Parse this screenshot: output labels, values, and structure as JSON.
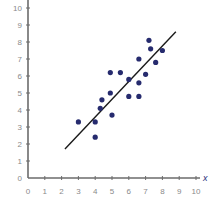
{
  "chart_data": {
    "type": "scatter",
    "title": "",
    "xlabel": "x",
    "ylabel": "",
    "xlim": [
      0,
      10
    ],
    "ylim": [
      0,
      10
    ],
    "x_ticks": [
      0,
      1,
      2,
      3,
      4,
      5,
      6,
      7,
      8,
      9,
      10
    ],
    "y_ticks": [
      0,
      1,
      2,
      3,
      4,
      5,
      6,
      7,
      8,
      9,
      10
    ],
    "grid": false,
    "legend": null,
    "series": [
      {
        "name": "data points",
        "type": "scatter",
        "color": "#262b6e",
        "points": [
          [
            3.0,
            3.3
          ],
          [
            4.0,
            3.3
          ],
          [
            4.0,
            2.4
          ],
          [
            4.3,
            4.1
          ],
          [
            4.4,
            4.6
          ],
          [
            5.0,
            3.7
          ],
          [
            4.9,
            5.0
          ],
          [
            4.9,
            6.2
          ],
          [
            5.5,
            6.2
          ],
          [
            6.0,
            5.8
          ],
          [
            6.6,
            5.6
          ],
          [
            6.0,
            4.8
          ],
          [
            6.6,
            4.8
          ],
          [
            6.6,
            7.0
          ],
          [
            7.0,
            6.1
          ],
          [
            7.2,
            8.1
          ],
          [
            7.3,
            7.6
          ],
          [
            7.6,
            6.8
          ],
          [
            8.0,
            7.5
          ]
        ]
      },
      {
        "name": "line of best fit",
        "type": "line",
        "color": "#1a1a1a",
        "points": [
          [
            2.2,
            1.7
          ],
          [
            8.8,
            8.6
          ]
        ]
      }
    ]
  },
  "colors": {
    "axis": "#6b6b6b",
    "tick_label": "#8a8a8a",
    "point": "#262b6e",
    "line": "#1a1a1a",
    "axis_name": "#2a2f7a"
  }
}
